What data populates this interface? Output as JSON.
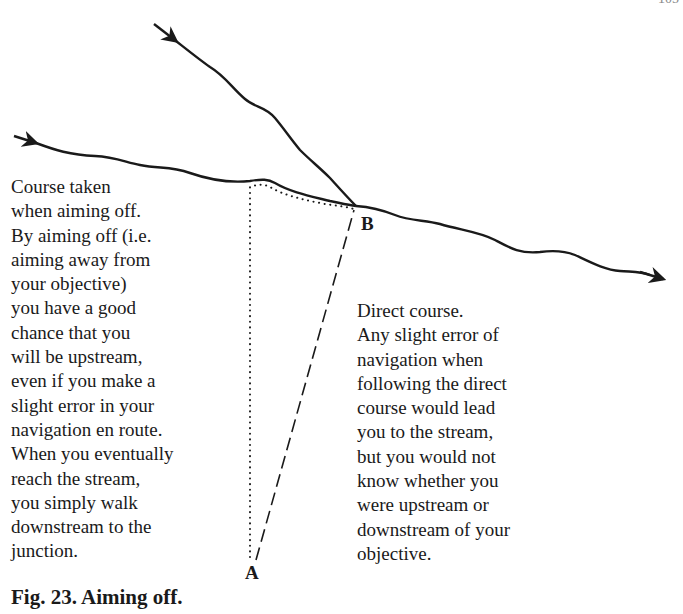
{
  "page": {
    "page_number_partial": "105"
  },
  "figure": {
    "title": "Fig. 23. Aiming off.",
    "points": {
      "a": "A",
      "b": "B"
    },
    "captions": {
      "aiming_off": "Course taken\nwhen aiming off.\nBy aiming off (i.e.\naiming away from\nyour objective)\nyou have a good\nchance that you\nwill be upstream,\neven if you make a\nslight error in your\nnavigation en route.\nWhen you eventually\nreach the stream,\nyou simply walk\ndownstream to the\njunction.",
      "direct": "Direct course.\nAny slight error of\nnavigation when\nfollowing the direct\ncourse would lead\nyou to the stream,\nbut you would not\nknow whether you\nwere upstream or\ndownstream of your\nobjective."
    },
    "elements": {
      "main_stream": "Main stream flowing left to right (arrows indicate flow)",
      "tributary": "Tributary joining from upper left at junction B",
      "aiming_off_route": "Dotted line: A north to stream, then along stream to B",
      "direct_route": "Dashed line: direct course from A to B"
    },
    "colors": {
      "ink": "#1a1a1a",
      "background": "#ffffff"
    }
  }
}
